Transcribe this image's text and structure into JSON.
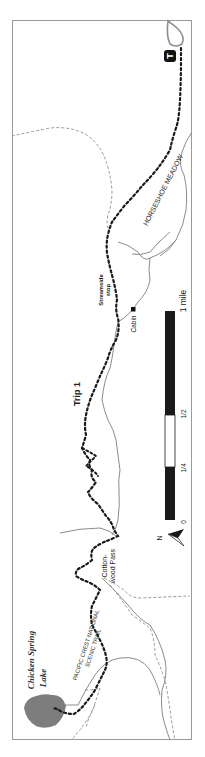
{
  "map": {
    "title": "Trip 1",
    "orientation": "rotated 90° counter-clockwise; north points left",
    "colors": {
      "frame": "#9a9a9a",
      "trail": "#1a1a1a",
      "stream": "#8c8c8c",
      "secondary_trail": "#8c8c8c",
      "lake": "#7d7d7d",
      "scale_dark": "#1a1a1a",
      "scale_light": "#ffffff",
      "trailhead": "#111111"
    },
    "labels": {
      "trip": "Trip 1",
      "meadow": "HORSESHOE MEADOW",
      "streamside_stop_line1": "Streamside",
      "streamside_stop_line2": "stop",
      "cabin": "Cabin",
      "pass_line1": "Cotton-",
      "pass_line2": "wood Pass",
      "pct_line1": "PACIFIC CREST NATIONAL",
      "pct_line2": "SCENIC TRAIL",
      "lake_line1": "Chicken Spring",
      "lake_line2": "Lake",
      "trailhead": "T",
      "north": "N"
    },
    "scale_bar": {
      "ticks": [
        "0",
        "1/4",
        "1/2",
        "1 mile"
      ]
    }
  }
}
